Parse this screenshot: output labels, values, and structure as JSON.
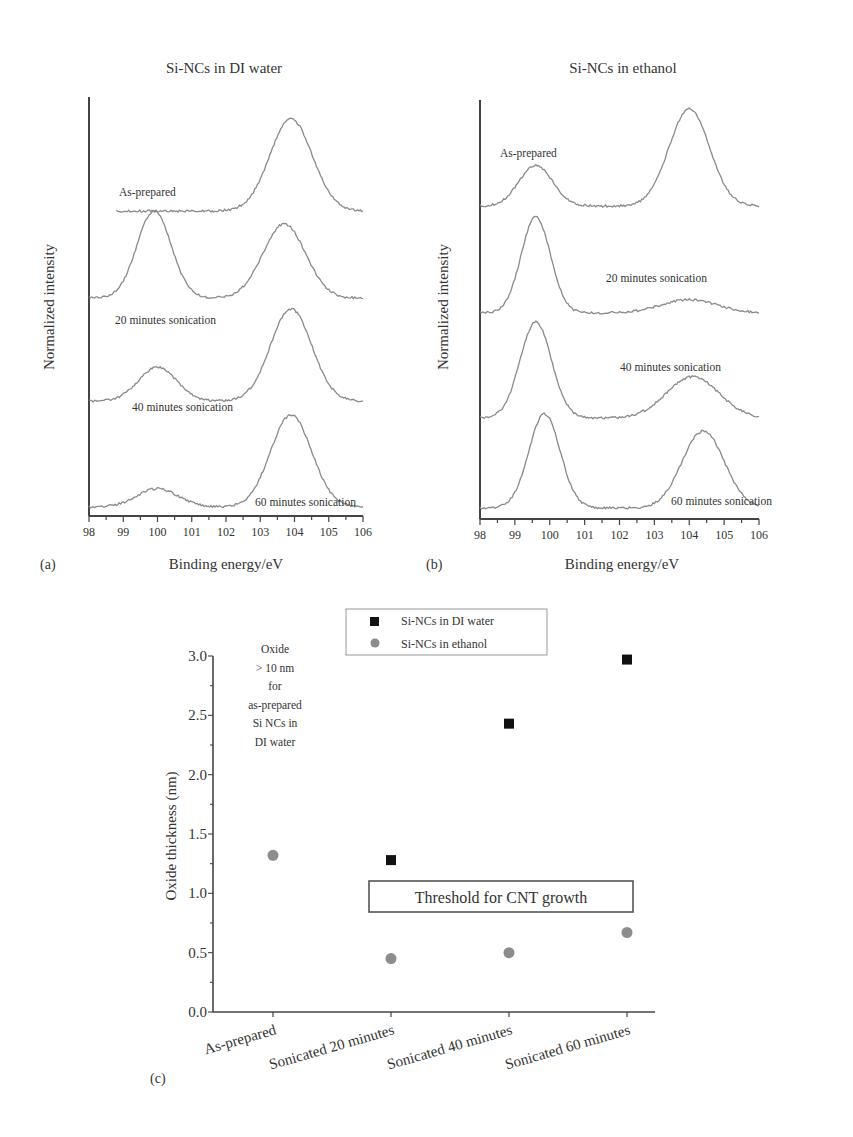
{
  "chart_data": [
    {
      "panel": "(a)",
      "type": "line",
      "title": "Si-NCs in DI water",
      "xlabel": "Binding energy/eV",
      "ylabel": "Normalized intensity",
      "xlim": [
        98,
        106
      ],
      "xticks": [
        "98",
        "99",
        "100",
        "101",
        "102",
        "103",
        "104",
        "105",
        "106"
      ],
      "grid": false,
      "series": [
        {
          "name": "As-prepared",
          "x_start": 98.8,
          "x_end": 106,
          "peaks": [
            {
              "center": 100.0,
              "height": 0.0,
              "width": 0.45
            },
            {
              "center": 103.9,
              "height": 1.0,
              "width": 0.62
            }
          ]
        },
        {
          "name": "20 minutes sonication",
          "x_start": 98,
          "x_end": 106,
          "peaks": [
            {
              "center": 99.9,
              "height": 1.0,
              "width": 0.5
            },
            {
              "center": 103.7,
              "height": 0.85,
              "width": 0.62
            }
          ]
        },
        {
          "name": "40 minutes sonication",
          "x_start": 98,
          "x_end": 106,
          "peaks": [
            {
              "center": 100.0,
              "height": 0.37,
              "width": 0.55
            },
            {
              "center": 103.9,
              "height": 1.0,
              "width": 0.6
            }
          ]
        },
        {
          "name": "60 minutes sonication",
          "x_start": 98,
          "x_end": 106,
          "peaks": [
            {
              "center": 100.0,
              "height": 0.2,
              "width": 0.6
            },
            {
              "center": 103.9,
              "height": 1.0,
              "width": 0.6
            }
          ]
        }
      ]
    },
    {
      "panel": "(b)",
      "type": "line",
      "title": "Si-NCs in ethanol",
      "xlabel": "Binding energy/eV",
      "ylabel": "Normalized intensity",
      "xlim": [
        98,
        106
      ],
      "xticks": [
        "98",
        "99",
        "100",
        "101",
        "102",
        "103",
        "104",
        "105",
        "106"
      ],
      "grid": false,
      "series": [
        {
          "name": "As-prepared",
          "x_start": 98,
          "x_end": 106,
          "peaks": [
            {
              "center": 99.6,
              "height": 0.42,
              "width": 0.48
            },
            {
              "center": 104.0,
              "height": 1.0,
              "width": 0.58
            }
          ]
        },
        {
          "name": "20 minutes sonication",
          "x_start": 98,
          "x_end": 106,
          "peaks": [
            {
              "center": 99.6,
              "height": 1.0,
              "width": 0.42
            },
            {
              "center": 104.0,
              "height": 0.14,
              "width": 0.8
            }
          ]
        },
        {
          "name": "40 minutes sonication",
          "x_start": 98,
          "x_end": 106,
          "peaks": [
            {
              "center": 99.6,
              "height": 1.0,
              "width": 0.45
            },
            {
              "center": 104.1,
              "height": 0.43,
              "width": 0.75
            }
          ]
        },
        {
          "name": "60 minutes sonication",
          "x_start": 98,
          "x_end": 106,
          "peaks": [
            {
              "center": 99.85,
              "height": 1.0,
              "width": 0.45
            },
            {
              "center": 104.4,
              "height": 0.82,
              "width": 0.6
            }
          ]
        }
      ]
    },
    {
      "panel": "(c)",
      "type": "scatter",
      "title": "",
      "xlabel": "",
      "ylabel": "Oxide thickness (nm)",
      "ylim": [
        0.0,
        3.0
      ],
      "yticks": [
        "0.0",
        "0.5",
        "1.0",
        "1.5",
        "2.0",
        "2.5",
        "3.0"
      ],
      "categories": [
        "As-prepared",
        "Sonicated 20 minutes",
        "Sonicated 40 minutes",
        "Sonicated 60 minutes"
      ],
      "grid": false,
      "legend_position": "top-center",
      "series": [
        {
          "name": "Si-NCs in DI water",
          "marker": "square",
          "color": "#111111",
          "values": [
            null,
            1.28,
            2.43,
            2.97
          ]
        },
        {
          "name": "Si-NCs in ethanol",
          "marker": "circle",
          "color": "#8c8c8c",
          "values": [
            1.32,
            0.45,
            0.5,
            0.67
          ]
        }
      ],
      "annotations": [
        {
          "text": "Oxide > 10 nm for as-prepared Si NCs in DI water",
          "lines": [
            "Oxide",
            "> 10 nm",
            "for",
            "as-prepared",
            "Si NCs in",
            "DI water"
          ]
        },
        {
          "text": "Threshold for CNT growth",
          "boxed": true,
          "y": 1.0
        }
      ]
    }
  ],
  "panels": {
    "a": {
      "label": "(a)",
      "title": "Si-NCs in DI water",
      "xlabel": "Binding energy/eV",
      "ylabel": "Normalized intensity"
    },
    "b": {
      "label": "(b)",
      "title": "Si-NCs in ethanol",
      "xlabel": "Binding energy/eV",
      "ylabel": "Normalized intensity"
    },
    "c": {
      "label": "(c)",
      "ylabel": "Oxide thickness (nm)",
      "threshold_label": "Threshold for CNT growth"
    }
  },
  "colors": {
    "curve": "#8a8a8a",
    "axis": "#444444",
    "water": "#111111",
    "ethanol": "#8c8c8c"
  }
}
